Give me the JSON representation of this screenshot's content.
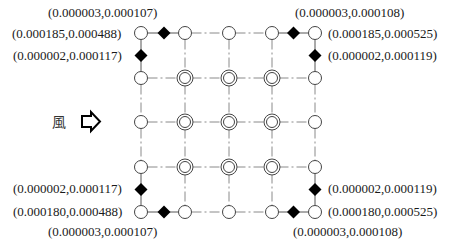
{
  "diagram": {
    "title": "",
    "wind": {
      "label": "風",
      "direction": "right",
      "icon": "hollow-arrow-right-icon"
    },
    "grid": {
      "columns": 5,
      "rows": 5,
      "outer_node_type": "single-circle",
      "inner_node_type": "double-circle",
      "line_style": "dash-dot"
    },
    "sensors": [
      {
        "id": "top-left-horizontal",
        "corner": "top-left",
        "position": "between corner and next node on top edge",
        "label": "(0.000003,0.000107)"
      },
      {
        "id": "top-left-corner",
        "corner": "top-left",
        "position": "corner node",
        "label": "(0.000185,0.000488)"
      },
      {
        "id": "top-left-vertical",
        "corner": "top-left",
        "position": "between corner and next node on left edge",
        "label": "(0.000002,0.000117)"
      },
      {
        "id": "top-right-horizontal",
        "corner": "top-right",
        "position": "between corner and next node on top edge",
        "label": "(0.000003,0.000108)"
      },
      {
        "id": "top-right-corner",
        "corner": "top-right",
        "position": "corner node",
        "label": "(0.000185,0.000525)"
      },
      {
        "id": "top-right-vertical",
        "corner": "top-right",
        "position": "between corner and next node on right edge",
        "label": "(0.000002,0.000119)"
      },
      {
        "id": "bottom-left-vertical",
        "corner": "bottom-left",
        "position": "between corner and next node on left edge",
        "label": "(0.000002,0.000117)"
      },
      {
        "id": "bottom-left-corner",
        "corner": "bottom-left",
        "position": "corner node",
        "label": "(0.000180,0.000488)"
      },
      {
        "id": "bottom-left-horizontal",
        "corner": "bottom-left",
        "position": "between corner and next node on bottom edge",
        "label": "(0.000003,0.000107)"
      },
      {
        "id": "bottom-right-vertical",
        "corner": "bottom-right",
        "position": "between corner and next node on right edge",
        "label": "(0.000002,0.000119)"
      },
      {
        "id": "bottom-right-corner",
        "corner": "bottom-right",
        "position": "corner node",
        "label": "(0.000180,0.000525)"
      },
      {
        "id": "bottom-right-horizontal",
        "corner": "bottom-right",
        "position": "between corner and next node on bottom edge",
        "label": "(0.000003,0.000108)"
      }
    ]
  }
}
